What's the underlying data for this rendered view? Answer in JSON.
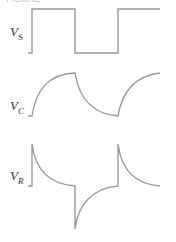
{
  "header_fragment": "FIGURE",
  "colors": {
    "trace": "#9a9a9a",
    "label": "#333333"
  },
  "signals": [
    {
      "id": "vs",
      "symbol": "V",
      "subscript": "S",
      "description": "source square wave"
    },
    {
      "id": "vc",
      "symbol": "V",
      "subscript": "C",
      "description": "capacitor voltage (exponential charge/discharge)"
    },
    {
      "id": "vr",
      "symbol": "V",
      "subscript": "R",
      "description": "resistor voltage (exponential spikes)"
    }
  ]
}
